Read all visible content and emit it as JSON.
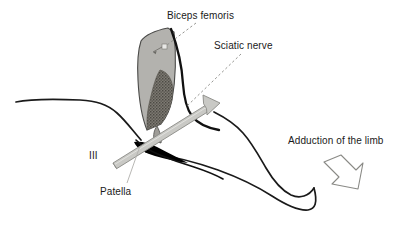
{
  "figure": {
    "background_color": "#ffffff",
    "width": 401,
    "height": 229
  },
  "labels": {
    "biceps_femoris": "Biceps femoris",
    "sciatic_nerve": "Sciatic nerve",
    "adduction": "Adduction of the limb",
    "patella": "Patella",
    "section_marker": "III"
  },
  "colors": {
    "outline": "#1a1a1a",
    "muscle_fill": "#b3b2ae",
    "muscle_stroke": "#4a4a48",
    "tendon_fill": "#6e6c66",
    "rod_fill": "#c9c9c5",
    "rod_stroke": "#8a8a86",
    "patella_fill": "#000000",
    "leader_line": "#8a8a86",
    "arrow_stroke": "#8a8a86",
    "text": "#1a1a1a"
  },
  "elements": {
    "body_outline_name": "limb silhouette",
    "muscle_name": "biceps femoris muscle belly",
    "tendon_name": "biceps femoris tendon insertion",
    "nerve_name": "sciatic nerve",
    "rod_name": "gray probe rod with arrowhead",
    "patella_name": "patella",
    "adduction_arrow_name": "adduction direction arrow"
  }
}
